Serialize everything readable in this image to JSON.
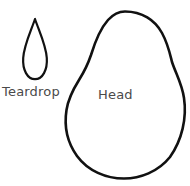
{
  "diagram": {
    "background_color": "#ffffff",
    "stroke_color": "#111111",
    "label_color": "#4a4a4a",
    "fill_color": "#ffffff",
    "width": 190,
    "height": 186,
    "shapes": [
      {
        "name": "teardrop",
        "label": "Teardrop",
        "stroke_width": 2.2,
        "description": "pointed-top rounded-bottom teardrop outline",
        "bounds": {
          "x": 22,
          "y": 19,
          "width": 26,
          "height": 61
        },
        "path": "M 35 19 C 31 31 24 45 23.2 58 C 22.4 70 27.5 79.2 35 79.2 C 42.5 79.2 47.6 70 46.8 58 C 46 45 39 31 35 19 Z"
      },
      {
        "name": "head",
        "label": "Head",
        "stroke_width": 2.6,
        "description": "large pear / egg shaped head outline, broad dome on top, bulbous rounded bottom, slight inflection on both sides",
        "bounds": {
          "x": 66,
          "y": 11,
          "width": 119,
          "height": 167
        },
        "path": "M 125 11.5 C 142 11.5 155 20 162 33 C 168 44 170 54 172 62 C 176 74 182 84 184 98 C 187 118 182 140 170 157 C 158 172 140 178.5 124 178.5 C 106 178.5 88 171 77 156 C 67 142 64 126 66.5 110 C 68.5 97 74 88 79 80 C 84 72 88 64 91 55 C 95 42 100 29 108 20 C 113 14.5 119 11.5 125 11.5 Z"
      }
    ]
  }
}
